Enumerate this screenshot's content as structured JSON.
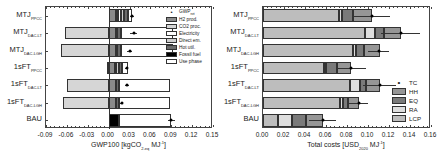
{
  "chart_data": [
    {
      "type": "bar",
      "orientation": "horizontal",
      "stacked": true,
      "title": "",
      "xlabel": "GWP100 [kgCO2-eq MJ-1]",
      "xlabel_parts": {
        "main": "GWP100 [kgCO",
        "sub": "2-eq",
        "tail": " MJ",
        "sup": "-1",
        "end": "]"
      },
      "ylabel": "",
      "xlim": [
        -0.09,
        0.15
      ],
      "xticks": [
        "-0.09",
        "-0.06",
        "-0.03",
        "0.00",
        "0.03",
        "0.06",
        "0.09",
        "0.12",
        "0.15"
      ],
      "categories": [
        {
          "main": "MTJ",
          "sub": "PPCC"
        },
        {
          "main": "MTJ",
          "sub": "DAC-LT"
        },
        {
          "main": "MTJ",
          "sub": "DAC-LGH"
        },
        {
          "main": "1sFT",
          "sub": "PPCC"
        },
        {
          "main": "1sFT",
          "sub": "DAC-LT"
        },
        {
          "main": "1sFT",
          "sub": "DAC-LGH"
        },
        {
          "main": "BAU",
          "sub": ""
        }
      ],
      "series": [
        {
          "name": "H2 prod.",
          "color": "#8a8a8a",
          "values": [
            0.01,
            0.01,
            0.01,
            0.009,
            0.01,
            0.01,
            0.0
          ]
        },
        {
          "name": "CO2 proc.",
          "color": "#d6d6d6",
          "values": [
            0.004,
            -0.062,
            -0.068,
            -0.003,
            -0.06,
            -0.065,
            0.0
          ]
        },
        {
          "name": "Electricity",
          "color": "#ffffff",
          "values": [
            0.004,
            0.002,
            0.002,
            0.002,
            0.001,
            0.001,
            0.0
          ]
        },
        {
          "name": "Direct em.",
          "color": "#cfcfcf",
          "values": [
            0.004,
            0.0,
            0.0,
            0.004,
            0.0,
            0.0,
            0.0
          ]
        },
        {
          "name": "Hot util.",
          "color": "#6a6a6a",
          "values": [
            0.006,
            0.006,
            0.006,
            0.004,
            0.004,
            0.004,
            0.0
          ]
        },
        {
          "name": "Fossil fuel",
          "color": "#000000",
          "values": [
            0.0,
            0.0,
            0.0,
            0.0,
            0.0,
            0.0,
            0.015
          ]
        },
        {
          "name": "Use phase",
          "color": "#ffffff",
          "values": [
            0.006,
            0.074,
            0.074,
            0.009,
            0.073,
            0.073,
            0.075
          ]
        }
      ],
      "net": {
        "name": "GWPnet",
        "values": [
          0.034,
          0.036,
          0.03,
          0.026,
          0.026,
          0.019,
          0.09
        ],
        "err": [
          0.003,
          0.005,
          0.003,
          0.002,
          0.003,
          0.002,
          0.005
        ]
      },
      "legend": [
        "GWPnet",
        "H2 prod.",
        "CO2 proc.",
        "Electricity",
        "Direct em.",
        "Hot util.",
        "Fossil fuel",
        "Use phase"
      ],
      "legend_position": "upper right",
      "grid": false
    },
    {
      "type": "bar",
      "orientation": "horizontal",
      "stacked": true,
      "title": "",
      "xlabel": "Total costs [USD2020 MJ-1]",
      "xlabel_parts": {
        "main": "Total costs [USD",
        "sub": "2020",
        "tail": " MJ",
        "sup": "-1",
        "end": "]"
      },
      "ylabel": "",
      "xlim": [
        0.0,
        0.16
      ],
      "xticks": [
        "0.00",
        "0.02",
        "0.04",
        "0.06",
        "0.08",
        "0.10",
        "0.12",
        "0.14",
        "0.16"
      ],
      "categories": [
        {
          "main": "MTJ",
          "sub": "PPCC"
        },
        {
          "main": "MTJ",
          "sub": "DAC-LT"
        },
        {
          "main": "MTJ",
          "sub": "DAC-LGH"
        },
        {
          "main": "1sFT",
          "sub": "PPCC"
        },
        {
          "main": "1sFT",
          "sub": "DAC-LT"
        },
        {
          "main": "1sFT",
          "sub": "DAC-LGH"
        },
        {
          "main": "BAU",
          "sub": ""
        }
      ],
      "series": [
        {
          "name": "LCP",
          "color": "#bdbdbd",
          "values": [
            0.072,
            0.097,
            0.086,
            0.058,
            0.083,
            0.073,
            0.014
          ]
        },
        {
          "name": "RA",
          "color": "#dedede",
          "values": [
            0.003,
            0.01,
            0.003,
            0.002,
            0.009,
            0.003,
            0.014
          ]
        },
        {
          "name": "EQ",
          "color": "#7a7a7a",
          "values": [
            0.011,
            0.008,
            0.007,
            0.01,
            0.006,
            0.005,
            0.013
          ]
        },
        {
          "name": "HH",
          "color": "#969696",
          "values": [
            0.018,
            0.016,
            0.015,
            0.014,
            0.013,
            0.01,
            0.016
          ]
        }
      ],
      "total": {
        "name": "TC",
        "values": [
          0.104,
          0.131,
          0.11,
          0.084,
          0.111,
          0.091,
          0.057
        ],
        "err": [
          0.017,
          0.019,
          0.01,
          0.014,
          0.016,
          0.009,
          0.013
        ]
      },
      "legend": [
        "TC",
        "HH",
        "EQ",
        "RA",
        "LCP"
      ],
      "legend_position": "lower right",
      "grid": false
    }
  ]
}
